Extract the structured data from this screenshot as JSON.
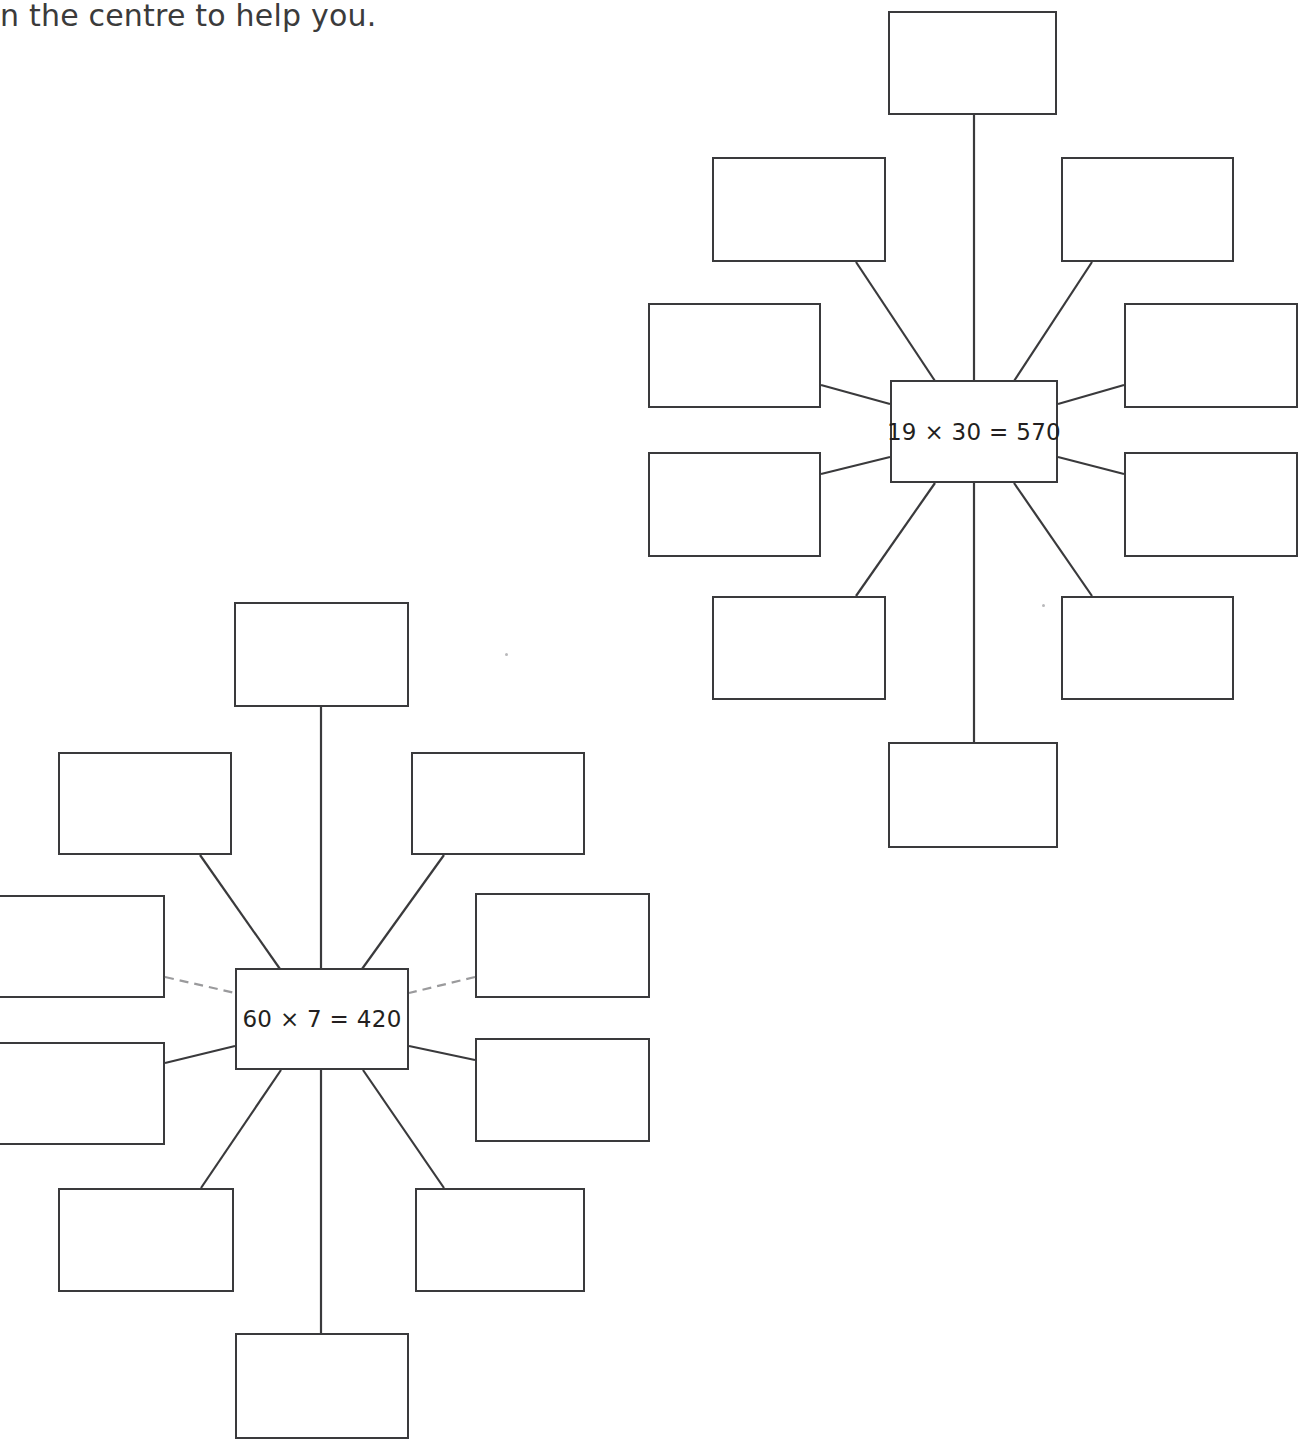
{
  "page": {
    "width": 1308,
    "height": 1389,
    "background_color": "#ffffff",
    "line_color": "#3a3a3c",
    "text_color": "#231f20"
  },
  "instruction": {
    "text": "n the centre to help you."
  },
  "diagrams": [
    {
      "id": "diagram-19x30",
      "name": "spider-diagram-19x30",
      "center": {
        "label": "19 × 30 = 570",
        "x": 890,
        "y": 380,
        "w": 168,
        "h": 103
      },
      "branches": [
        {
          "index": 0,
          "label": "",
          "x": 888,
          "y": 11,
          "w": 169,
          "h": 104,
          "connector": "vertical"
        },
        {
          "index": 1,
          "label": "",
          "x": 712,
          "y": 157,
          "w": 174,
          "h": 105,
          "connector": "diagonal"
        },
        {
          "index": 2,
          "label": "",
          "x": 1061,
          "y": 157,
          "w": 173,
          "h": 105,
          "connector": "diagonal"
        },
        {
          "index": 3,
          "label": "",
          "x": 648,
          "y": 303,
          "w": 173,
          "h": 105,
          "connector": "horizontal"
        },
        {
          "index": 4,
          "label": "",
          "x": 1124,
          "y": 303,
          "w": 174,
          "h": 105,
          "connector": "horizontal"
        },
        {
          "index": 5,
          "label": "",
          "x": 648,
          "y": 452,
          "w": 173,
          "h": 105,
          "connector": "horizontal"
        },
        {
          "index": 6,
          "label": "",
          "x": 1124,
          "y": 452,
          "w": 174,
          "h": 105,
          "connector": "horizontal"
        },
        {
          "index": 7,
          "label": "",
          "x": 712,
          "y": 596,
          "w": 174,
          "h": 104,
          "connector": "diagonal"
        },
        {
          "index": 8,
          "label": "",
          "x": 1061,
          "y": 596,
          "w": 173,
          "h": 104,
          "connector": "diagonal"
        },
        {
          "index": 9,
          "label": "",
          "x": 888,
          "y": 742,
          "w": 170,
          "h": 106,
          "connector": "vertical"
        }
      ]
    },
    {
      "id": "diagram-60x7",
      "name": "spider-diagram-60x7",
      "center": {
        "label": "60 × 7 = 420",
        "x": 235,
        "y": 968,
        "w": 174,
        "h": 102
      },
      "branches": [
        {
          "index": 0,
          "label": "",
          "x": 234,
          "y": 602,
          "w": 175,
          "h": 105,
          "connector": "vertical"
        },
        {
          "index": 1,
          "label": "",
          "x": 58,
          "y": 752,
          "w": 174,
          "h": 103,
          "connector": "diagonal"
        },
        {
          "index": 2,
          "label": "",
          "x": 411,
          "y": 752,
          "w": 174,
          "h": 103,
          "connector": "diagonal"
        },
        {
          "index": 3,
          "label": "",
          "x": -12,
          "y": 895,
          "w": 177,
          "h": 103,
          "connector": "horizontal-faded"
        },
        {
          "index": 4,
          "label": "",
          "x": 475,
          "y": 893,
          "w": 175,
          "h": 105,
          "connector": "horizontal-faded"
        },
        {
          "index": 5,
          "label": "",
          "x": -12,
          "y": 1042,
          "w": 177,
          "h": 103,
          "connector": "horizontal"
        },
        {
          "index": 6,
          "label": "",
          "x": 475,
          "y": 1038,
          "w": 175,
          "h": 104,
          "connector": "horizontal"
        },
        {
          "index": 7,
          "label": "",
          "x": 58,
          "y": 1188,
          "w": 176,
          "h": 104,
          "connector": "diagonal"
        },
        {
          "index": 8,
          "label": "",
          "x": 415,
          "y": 1188,
          "w": 170,
          "h": 104,
          "connector": "diagonal"
        },
        {
          "index": 9,
          "label": "",
          "x": 235,
          "y": 1333,
          "w": 174,
          "h": 106,
          "connector": "vertical"
        }
      ]
    }
  ],
  "marks": [
    {
      "name": "stray-speck",
      "x": 505,
      "y": 653
    },
    {
      "name": "stray-speck",
      "x": 1042,
      "y": 604
    }
  ]
}
